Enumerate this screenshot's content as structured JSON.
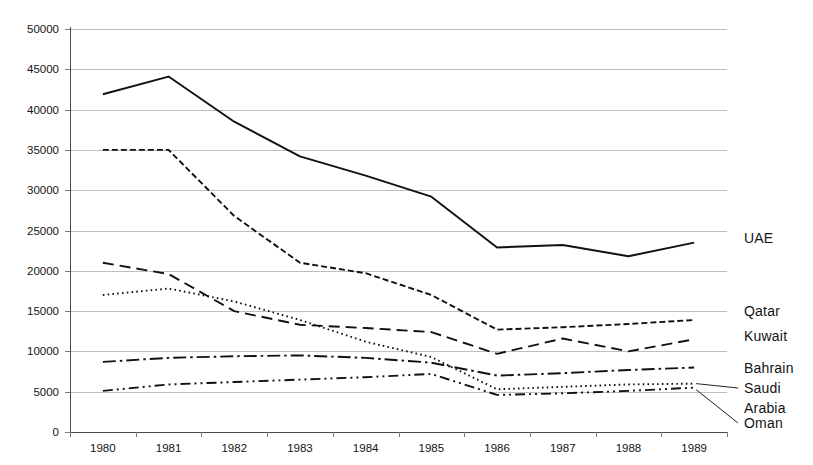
{
  "chart_data": {
    "type": "line",
    "title": "",
    "xlabel": "",
    "ylabel": "",
    "categories": [
      "1980",
      "1981",
      "1982",
      "1983",
      "1984",
      "1985",
      "1986",
      "1987",
      "1988",
      "1989"
    ],
    "ylim": [
      0,
      50000
    ],
    "ytick_values": [
      0,
      5000,
      10000,
      15000,
      20000,
      25000,
      30000,
      35000,
      40000,
      45000,
      50000
    ],
    "ytick_labels": [
      "0",
      "5000",
      "10000",
      "15000",
      "20000",
      "25000",
      "30000",
      "35000",
      "40000",
      "45000",
      "50000"
    ],
    "grid": true,
    "legend_position": "right-inline-labels",
    "series": [
      {
        "name": "UAE",
        "label": "UAE",
        "dash": "solid",
        "values": [
          41900,
          44100,
          38500,
          34200,
          31800,
          29200,
          22900,
          23200,
          21800,
          23500
        ]
      },
      {
        "name": "Qatar",
        "label": "Qatar",
        "dash": "dashed-fine",
        "values": [
          35000,
          35000,
          26800,
          21000,
          19700,
          17000,
          12700,
          13000,
          13400,
          13900
        ]
      },
      {
        "name": "Kuwait",
        "label": "Kuwait",
        "dash": "dashed-coarse",
        "values": [
          21000,
          19600,
          15000,
          13300,
          12900,
          12400,
          9700,
          11600,
          10000,
          11500
        ]
      },
      {
        "name": "Bahrain",
        "label": "Bahrain",
        "dash": "dash-dot",
        "values": [
          8700,
          9200,
          9400,
          9500,
          9200,
          8600,
          7000,
          7300,
          7700,
          8000
        ]
      },
      {
        "name": "Saudi Arabia",
        "label": "Saudi\nArabia",
        "label_line1": "Saudi",
        "label_line2": "Arabia",
        "dash": "dotted",
        "values": [
          17000,
          17800,
          16200,
          13900,
          11200,
          9300,
          5300,
          5600,
          5900,
          6000
        ]
      },
      {
        "name": "Oman",
        "label": "Oman",
        "dash": "dash-dot-dot",
        "values": [
          5100,
          5900,
          6200,
          6500,
          6800,
          7200,
          4600,
          4800,
          5100,
          5500
        ]
      }
    ]
  },
  "axis": {
    "x_tick_count": 11,
    "y_min_label": "0",
    "y_max_label": "50000"
  },
  "colors": {
    "line": "#111111",
    "grid": "#bfbfbf",
    "axis": "#4a4a4a",
    "text": "#141414",
    "background": "#ffffff"
  }
}
